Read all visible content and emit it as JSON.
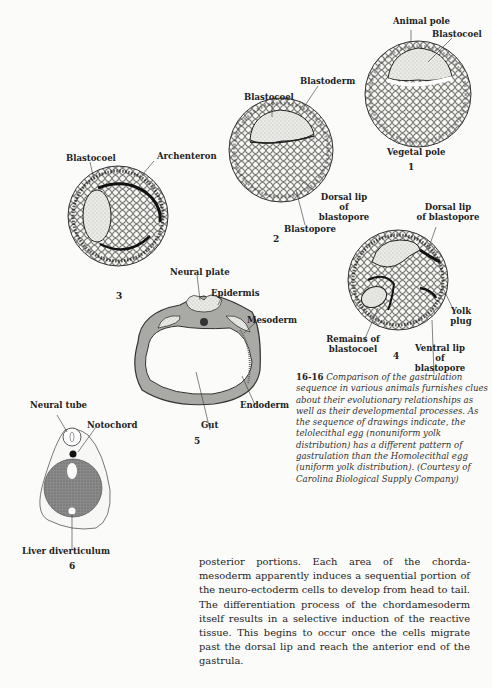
{
  "figure": {
    "number": "16-16",
    "caption": "Comparison of the gastrulation sequence in various animals furnishes clues about their evolutionary relationships as well as their developmental processes. As the sequence of drawings indicate, the telolecithal egg (nonuniform yolk distribution) has a different pattern of gastrulation than the Homolecithal egg (uniform yolk distribution). (Courtesy of Carolina Biological Supply Company)",
    "panels": [
      {
        "id": "1",
        "labels": [
          "Animal pole",
          "Blastocoel",
          "Vegetal pole"
        ]
      },
      {
        "id": "2",
        "labels": [
          "Blastoderm",
          "Blastocoel",
          "Dorsal lip of blastopore",
          "Blastopore"
        ]
      },
      {
        "id": "3",
        "labels": [
          "Blastocoel",
          "Archenteron"
        ]
      },
      {
        "id": "4",
        "labels": [
          "Dorsal lip of blastopore",
          "Yolk plug",
          "Remains of blastocoel",
          "Ventral lip of blastopore"
        ]
      },
      {
        "id": "5",
        "labels": [
          "Neural plate",
          "Epidermis",
          "Mesoderm",
          "Endoderm",
          "Gut"
        ]
      },
      {
        "id": "6",
        "labels": [
          "Neural tube",
          "Notochord",
          "Liver diverticulum"
        ]
      }
    ]
  },
  "labels": {
    "p1_animal_pole": "Animal pole",
    "p1_blastocoel": "Blastocoel",
    "p1_vegetal_pole": "Vegetal pole",
    "p2_blastoderm": "Blastoderm",
    "p2_blastocoel": "Blastocoel",
    "p2_dorsal_lip_1": "Dorsal lip",
    "p2_dorsal_lip_2": "of",
    "p2_dorsal_lip_3": "blastopore",
    "p2_blastopore": "Blastopore",
    "p3_blastocoel": "Blastocoel",
    "p3_archenteron": "Archenteron",
    "p4_dorsal_lip_1": "Dorsal lip",
    "p4_dorsal_lip_2": "of blastopore",
    "p4_yolk_1": "Yolk",
    "p4_yolk_2": "plug",
    "p4_remains_1": "Remains of",
    "p4_remains_2": "blastocoel",
    "p4_ventral_1": "Ventral lip",
    "p4_ventral_2": "of",
    "p4_ventral_3": "blastopore",
    "p5_neural_plate": "Neural plate",
    "p5_epidermis": "Epidermis",
    "p5_mesoderm": "Mesoderm",
    "p5_endoderm": "Endoderm",
    "p5_gut": "Gut",
    "p6_neural_tube": "Neural tube",
    "p6_notochord": "Notochord",
    "p6_liver": "Liver diverticulum"
  },
  "panel_numbers": {
    "n1": "1",
    "n2": "2",
    "n3": "3",
    "n4": "4",
    "n5": "5",
    "n6": "6"
  },
  "body_text": "posterior portions. Each area of the chorda-mesoderm apparently induces a sequential portion of the neuro-ectoderm cells to develop from head to tail. The differentiation process of the chordamesoderm itself results in a selective induction of the reactive tissue. This begins to occur once the cells migrate past the dorsal lip and reach the anterior end of the gastrula."
}
